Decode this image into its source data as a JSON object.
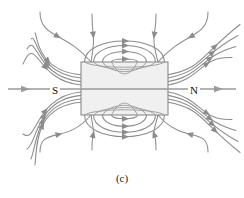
{
  "figure": {
    "caption": "(c)",
    "kind": "magnetic-field-lines-bar-magnet",
    "background_color": "#ffffff",
    "line_color": "#8c8c8c",
    "magnet": {
      "label_south": "S",
      "label_north": "N",
      "x": 81,
      "y": 62,
      "width": 87,
      "height": 53,
      "fill_color": "#f0f0f0",
      "stroke_color": "#808080"
    },
    "axis": {
      "y": 89,
      "left_start_x": 8,
      "left_end_x": 81,
      "right_start_x": 168,
      "right_end_x": 236,
      "left_arrow_x": 26,
      "right_arrow_x": 219,
      "direction": "left-to-right"
    }
  },
  "chart_data": {
    "type": "line",
    "title": "(c)",
    "xlabel": "",
    "ylabel": "",
    "annotations": [
      "S",
      "N",
      "(c)"
    ],
    "legend": [],
    "grid": false,
    "series": [
      {
        "name": "axis-line-left",
        "kind": "straight",
        "points": [
          [
            8,
            89
          ],
          [
            81,
            89
          ]
        ],
        "arrows": [
          {
            "x": 26,
            "y": 89,
            "angle": 0
          }
        ]
      },
      {
        "name": "axis-line-right",
        "kind": "straight",
        "points": [
          [
            168,
            89
          ],
          [
            236,
            89
          ]
        ],
        "arrows": [
          {
            "x": 219,
            "y": 89,
            "angle": 0
          }
        ]
      },
      {
        "name": "inner-loop-top-1",
        "kind": "arc-top",
        "half_width": 13,
        "apex_y": 40,
        "entry_y": 72,
        "arrow_t": 0.5
      },
      {
        "name": "inner-loop-top-2",
        "kind": "arc-top",
        "half_width": 22,
        "apex_y": 30,
        "entry_y": 69,
        "arrow_t": 0.5
      },
      {
        "name": "inner-loop-top-3",
        "kind": "arc-top",
        "half_width": 31,
        "apex_y": 22,
        "entry_y": 66,
        "arrow_t": 0.5
      },
      {
        "name": "inner-loop-top-4",
        "kind": "arc-top",
        "half_width": 40,
        "apex_y": 16,
        "entry_y": 63,
        "arrow_t": 0.5
      },
      {
        "name": "inner-loop-bottom-1",
        "kind": "arc-bottom",
        "half_width": 13,
        "apex_y": 138,
        "entry_y": 105,
        "arrow_t": 0.5
      },
      {
        "name": "inner-loop-bottom-2",
        "kind": "arc-bottom",
        "half_width": 22,
        "apex_y": 148,
        "entry_y": 108,
        "arrow_t": 0.5
      },
      {
        "name": "inner-loop-bottom-3",
        "kind": "arc-bottom",
        "half_width": 31,
        "apex_y": 156,
        "entry_y": 111,
        "arrow_t": 0.5
      },
      {
        "name": "inner-loop-bottom-4",
        "kind": "arc-bottom",
        "half_width": 40,
        "apex_y": 162,
        "entry_y": 114,
        "arrow_t": 0.5
      },
      {
        "name": "outer-line-top-1",
        "kind": "open-top",
        "entry_y": 74,
        "exit_y": 74,
        "spread": 1
      },
      {
        "name": "outer-line-top-2",
        "kind": "open-top",
        "entry_y": 71,
        "exit_y": 71,
        "spread": 2
      },
      {
        "name": "outer-line-top-3",
        "kind": "open-top",
        "entry_y": 67,
        "exit_y": 67,
        "spread": 3
      },
      {
        "name": "outer-line-top-4",
        "kind": "open-top",
        "entry_y": 63,
        "exit_y": 63,
        "spread": 4
      },
      {
        "name": "outer-line-bottom-1",
        "kind": "open-bottom",
        "entry_y": 104,
        "exit_y": 104,
        "spread": 1
      },
      {
        "name": "outer-line-bottom-2",
        "kind": "open-bottom",
        "entry_y": 107,
        "exit_y": 107,
        "spread": 2
      },
      {
        "name": "outer-line-bottom-3",
        "kind": "open-bottom",
        "entry_y": 111,
        "exit_y": 111,
        "spread": 3
      },
      {
        "name": "outer-line-bottom-4",
        "kind": "open-bottom",
        "entry_y": 114,
        "exit_y": 114,
        "spread": 4
      }
    ]
  }
}
